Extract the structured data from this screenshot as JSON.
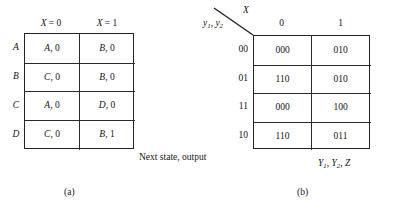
{
  "figure": {
    "panel_a": {
      "caption": "(a)",
      "annotation": "Next state, output",
      "column_headers": [
        "X = 0",
        "X = 1"
      ],
      "row_headers": [
        "A",
        "B",
        "C",
        "D"
      ],
      "rows": [
        [
          "A, 0",
          "B, 0"
        ],
        [
          "C, 0",
          "B, 0"
        ],
        [
          "A, 0",
          "D, 0"
        ],
        [
          "C, 0",
          "B, 1"
        ]
      ]
    },
    "panel_b": {
      "caption": "(b)",
      "corner_col_label": "X",
      "corner_row_label": "y1, y2",
      "outputs_label": "Y1, Y2, Z",
      "column_headers": [
        "0",
        "1"
      ],
      "row_headers": [
        "00",
        "01",
        "11",
        "10"
      ],
      "rows": [
        [
          "000",
          "010"
        ],
        [
          "110",
          "010"
        ],
        [
          "000",
          "100"
        ],
        [
          "110",
          "011"
        ]
      ]
    }
  },
  "colors": {
    "background": "#ffffff",
    "ink": "#161616",
    "rule": "#2a2a2a"
  }
}
